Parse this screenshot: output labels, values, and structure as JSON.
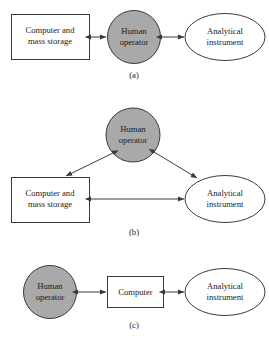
{
  "figure": {
    "background_color": "#ffffff",
    "stroke_color": "#3a3a3a",
    "operator_fill_color": "#a9a9a9",
    "shape_fill_color": "#ffffff"
  },
  "panels": [
    {
      "id": "a",
      "caption": "(a)",
      "nodes": [
        {
          "id": "computer_storage_a",
          "shape": "rectangle",
          "fill": "#ffffff",
          "lines": [
            "Computer and",
            "mass storage"
          ]
        },
        {
          "id": "human_operator_a",
          "shape": "circle",
          "fill": "#a9a9a9",
          "lines": [
            "Human",
            "operator"
          ]
        },
        {
          "id": "analytical_instrument_a",
          "shape": "ellipse",
          "fill": "#ffffff",
          "lines": [
            "Analytical",
            "instrument"
          ]
        }
      ],
      "connections": [
        {
          "from": "computer_storage_a",
          "to": "human_operator_a",
          "style": "double-arrow"
        },
        {
          "from": "human_operator_a",
          "to": "analytical_instrument_a",
          "style": "double-arrow"
        }
      ]
    },
    {
      "id": "b",
      "caption": "(b)",
      "nodes": [
        {
          "id": "human_operator_b",
          "shape": "circle",
          "fill": "#a9a9a9",
          "lines": [
            "Human",
            "operator"
          ]
        },
        {
          "id": "computer_storage_b",
          "shape": "rectangle",
          "fill": "#ffffff",
          "lines": [
            "Computer and",
            "mass storage"
          ]
        },
        {
          "id": "analytical_instrument_b",
          "shape": "ellipse",
          "fill": "#ffffff",
          "lines": [
            "Analytical",
            "instrument"
          ]
        }
      ],
      "connections": [
        {
          "from": "human_operator_b",
          "to": "computer_storage_b",
          "style": "double-arrow"
        },
        {
          "from": "human_operator_b",
          "to": "analytical_instrument_b",
          "style": "double-arrow"
        },
        {
          "from": "computer_storage_b",
          "to": "analytical_instrument_b",
          "style": "double-arrow"
        }
      ]
    },
    {
      "id": "c",
      "caption": "(c)",
      "nodes": [
        {
          "id": "human_operator_c",
          "shape": "circle",
          "fill": "#a9a9a9",
          "lines": [
            "Human",
            "operator"
          ]
        },
        {
          "id": "computer_c",
          "shape": "rectangle",
          "fill": "#ffffff",
          "lines": [
            "Computer"
          ]
        },
        {
          "id": "analytical_instrument_c",
          "shape": "ellipse",
          "fill": "#ffffff",
          "lines": [
            "Analytical",
            "instrument"
          ]
        }
      ],
      "connections": [
        {
          "from": "human_operator_c",
          "to": "computer_c",
          "style": "double-arrow"
        },
        {
          "from": "computer_c",
          "to": "analytical_instrument_c",
          "style": "double-arrow"
        }
      ]
    }
  ],
  "labels": {
    "computer_and_mass_storage_l1": "Computer and",
    "computer_and_mass_storage_l2": "mass storage",
    "human_operator_l1": "Human",
    "human_operator_l2": "operator",
    "analytical_instrument_l1": "Analytical",
    "analytical_instrument_l2": "instrument",
    "computer": "Computer",
    "caption_a": "(a)",
    "caption_b": "(b)",
    "caption_c": "(c)"
  }
}
